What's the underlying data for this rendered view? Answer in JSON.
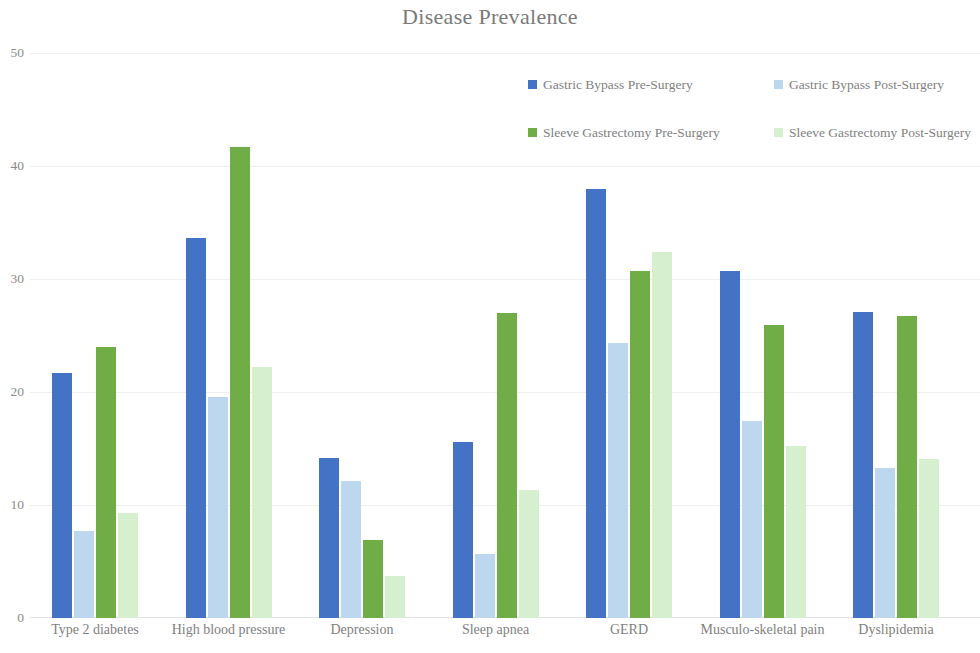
{
  "chart_data": {
    "type": "bar",
    "title": "Disease Prevalence",
    "xlabel": "",
    "ylabel": "",
    "ylim": [
      0,
      50
    ],
    "yticks": [
      0,
      10,
      20,
      30,
      40,
      50
    ],
    "grid": true,
    "legend_position": "top-right",
    "categories": [
      "Type 2 diabetes",
      "High blood pressure",
      "Depression",
      "Sleep apnea",
      "GERD",
      "Musculo-skeletal pain",
      "Dyslipidemia"
    ],
    "series": [
      {
        "name": "Gastric Bypass Pre-Surgery",
        "color": "#4472C4",
        "values": [
          21.7,
          33.6,
          14.2,
          15.6,
          38.0,
          30.7,
          27.1
        ]
      },
      {
        "name": "Gastric Bypass Post-Surgery",
        "color": "#BDD7EE",
        "values": [
          7.7,
          19.6,
          12.1,
          5.7,
          24.3,
          17.4,
          13.3
        ]
      },
      {
        "name": "Sleeve Gastrectomy Pre-Surgery",
        "color": "#70AD47",
        "values": [
          24.0,
          41.7,
          6.9,
          27.0,
          30.7,
          25.9,
          26.7
        ]
      },
      {
        "name": "Sleeve Gastrectomy Post-Surgery",
        "color": "#D6EFCE",
        "values": [
          9.3,
          22.2,
          3.7,
          11.3,
          32.4,
          15.2,
          14.1
        ]
      }
    ]
  },
  "axis": {
    "y_tick_labels": [
      "50",
      "40",
      "30",
      "20",
      "10",
      "0"
    ]
  }
}
